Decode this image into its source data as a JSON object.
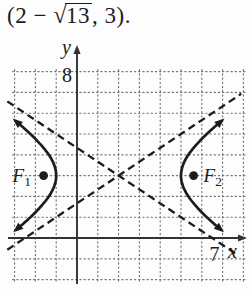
{
  "header": {
    "expression": {
      "prefix": "(2 − ",
      "radical_symbol": "√",
      "radicand": "13",
      "suffix": ", 3)."
    }
  },
  "colors": {
    "background": "#fdfdfd",
    "ink": "#1c1c1c",
    "axis": "#333333",
    "grid": "#757575"
  },
  "chart_data": {
    "type": "line",
    "subtype": "hyperbola-graph",
    "title": "",
    "xlabel": "x",
    "ylabel": "y",
    "x_tick_label": "7",
    "x_tick_value": 7,
    "y_tick_label": "8",
    "y_tick_value": 8,
    "grid": {
      "style": "dotted",
      "x_range": [
        -3,
        8
      ],
      "y_range": [
        -2,
        8
      ],
      "step": 1
    },
    "center": {
      "x": 2,
      "y": 3
    },
    "semi_transverse_a": 3,
    "semi_conjugate_b": 2,
    "orientation": "horizontal",
    "branch_y_span": [
      0.4,
      5.62
    ],
    "asymptotes": [
      {
        "slope": 0.6667,
        "x_span": [
          -3.35,
          7.9
        ]
      },
      {
        "slope": -0.6667,
        "x_span": [
          -3.35,
          7.75
        ]
      }
    ],
    "foci": [
      {
        "x": -1.6056,
        "y": 3,
        "label": "F",
        "sub": "1",
        "label_side": "left"
      },
      {
        "x": 5.6056,
        "y": 3,
        "label": "F",
        "sub": "2",
        "label_side": "right"
      }
    ]
  }
}
